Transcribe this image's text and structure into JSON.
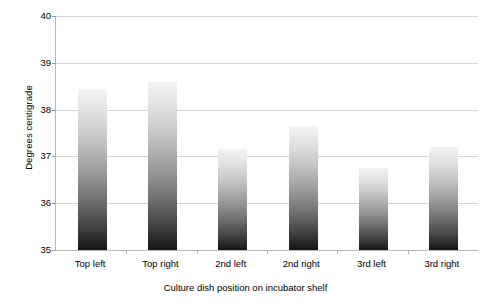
{
  "chart_data": {
    "type": "bar",
    "title": "",
    "subtitle": "",
    "xlabel": "Culture dish position on incubator shelf",
    "ylabel": "Degrees centigrade",
    "categories": [
      "Top left",
      "Top right",
      "2nd left",
      "2nd right",
      "3rd left",
      "3rd right"
    ],
    "values": [
      38.45,
      38.6,
      37.15,
      37.65,
      36.75,
      37.2
    ],
    "series": [
      {
        "name": "Temperature",
        "values": [
          38.45,
          38.6,
          37.15,
          37.65,
          36.75,
          37.2
        ]
      }
    ],
    "ylim": [
      35,
      40
    ],
    "ytick_labels": [
      "35",
      "36",
      "37",
      "38",
      "39",
      "40"
    ],
    "ytick_values": [
      35,
      36,
      37,
      38,
      39,
      40
    ],
    "ytick_step": 1,
    "grid": true,
    "grid_axis": "y",
    "legend": false,
    "legend_position": "none",
    "bar_fill": "vertical-gradient",
    "bar_color_top": "#f4f4f4",
    "bar_color_bottom": "#151515",
    "gridline_color": "#d4d4d4",
    "axis_color": "#b9b9b9",
    "background": "#ffffff"
  }
}
